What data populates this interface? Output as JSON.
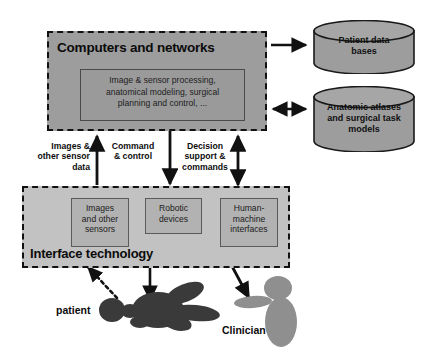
{
  "diagram": {
    "computers": {
      "title": "Computers and networks",
      "processing_text": "Image & sensor processing,\nanatomical modeling, surgical\nplanning and control, ...",
      "fill_color": "#9d9d9d",
      "inner_fill_color": "#9a9a9a"
    },
    "databases": [
      {
        "id": "patient-data-bases",
        "label": "Patient data\nbases",
        "fill_color": "#9d9d9d"
      },
      {
        "id": "anatomic-atlases",
        "label": "Anatomic atlases\nand surgical task\nmodels",
        "fill_color": "#9d9d9d"
      }
    ],
    "db_connectors": [
      {
        "id": "to-patient-data-bases",
        "direction": "right"
      },
      {
        "id": "to-anatomic-atlases",
        "direction": "bidirectional"
      }
    ],
    "connectors": [
      {
        "id": "images-and-other-sensor-data",
        "label": "Images &\nother sensor\ndata",
        "direction": "up"
      },
      {
        "id": "command-and-control",
        "label": "Command\n& control",
        "direction": "down"
      },
      {
        "id": "decision-support-and-commands",
        "label": "Decision\nsupport &\ncommands",
        "direction": "bidirectional"
      }
    ],
    "interface": {
      "title": "Interface technology",
      "fill_color": "#c2c2c2",
      "items": [
        {
          "id": "images-and-other-sensors",
          "label": "Images\nand other\nsensors"
        },
        {
          "id": "robotic-devices",
          "label": "Robotic\ndevices"
        },
        {
          "id": "human-machine-interfaces",
          "label": "Human-\nmachine\ninterfaces"
        }
      ]
    },
    "actors": [
      {
        "id": "patient",
        "label": "patient",
        "fill_color": "#3a3a3a"
      },
      {
        "id": "clinician",
        "label": "Clinician",
        "fill_color": "#8f8f8f"
      }
    ]
  }
}
